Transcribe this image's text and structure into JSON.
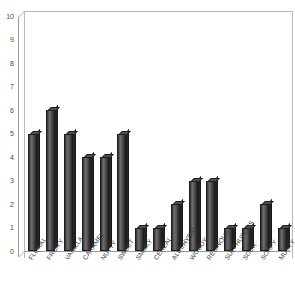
{
  "chart_data": {
    "type": "bar",
    "title": "",
    "subtitle": "",
    "xlabel": "",
    "ylabel": "",
    "ylim": [
      0,
      10
    ],
    "yticks": [
      0,
      1,
      2,
      3,
      4,
      5,
      6,
      7,
      8,
      9,
      10
    ],
    "grid": false,
    "legend": false,
    "categories": [
      "FLORAL",
      "FRUITY",
      "VANILLA",
      "CARAMEL",
      "NUTTY",
      "SWEET",
      "SMOKY",
      "CEREAL",
      "ALDEHYDIC",
      "WOODY",
      "RESINOUS",
      "SULPHUROUS",
      "SOUR",
      "SOAPY",
      "MUSTY"
    ],
    "values": [
      5,
      6,
      5,
      4,
      4,
      5,
      1,
      1,
      2,
      3,
      3,
      1,
      1,
      2,
      1
    ],
    "bar_color": "#4f4f4f",
    "bar_edge_color": "#1d1d1d",
    "axis_color": "#9a9a9a",
    "background_color": "#ffffff"
  }
}
